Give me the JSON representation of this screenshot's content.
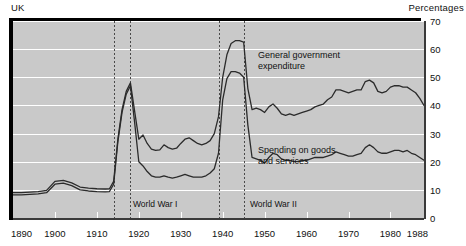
{
  "header": {
    "country_label": "UK",
    "unit_label": "Percentages"
  },
  "axes": {
    "y_ticks": [
      0,
      10,
      20,
      30,
      40,
      50,
      60,
      70
    ],
    "x_ticks": [
      1890,
      1900,
      1910,
      1920,
      1930,
      1940,
      1950,
      1960,
      1970,
      1980,
      1988
    ]
  },
  "annotations": {
    "series1_label": "General government\nexpenditure",
    "series2_label": "Spending on goods\nand services",
    "war1_label": "World War I",
    "war2_label": "World War II"
  },
  "colors": {
    "plot_background": "#c9c9c9",
    "gridline": "#ffffff",
    "line": "#2b2b2b",
    "axis": "#3a3a3a",
    "shadow": "#000000"
  },
  "chart_data": {
    "type": "line",
    "title": "",
    "xlabel": "",
    "ylabel": "Percentages",
    "xlim": [
      1890,
      1988
    ],
    "ylim": [
      0,
      70
    ],
    "grid": true,
    "legend": "inline-annotations",
    "event_markers": [
      {
        "label": "World War I",
        "start": 1914,
        "end": 1918
      },
      {
        "label": "World War II",
        "start": 1939,
        "end": 1945
      }
    ],
    "series": [
      {
        "name": "General government expenditure",
        "x": [
          1890,
          1892,
          1894,
          1896,
          1898,
          1900,
          1902,
          1904,
          1906,
          1908,
          1910,
          1912,
          1913,
          1914,
          1915,
          1916,
          1917,
          1918,
          1919,
          1920,
          1921,
          1922,
          1923,
          1924,
          1925,
          1926,
          1927,
          1928,
          1929,
          1930,
          1931,
          1932,
          1933,
          1934,
          1935,
          1936,
          1937,
          1938,
          1939,
          1940,
          1941,
          1942,
          1943,
          1944,
          1945,
          1946,
          1947,
          1948,
          1949,
          1950,
          1951,
          1952,
          1953,
          1954,
          1955,
          1956,
          1957,
          1958,
          1959,
          1960,
          1961,
          1962,
          1963,
          1964,
          1965,
          1966,
          1967,
          1968,
          1969,
          1970,
          1971,
          1972,
          1973,
          1974,
          1975,
          1976,
          1977,
          1978,
          1979,
          1980,
          1981,
          1982,
          1983,
          1984,
          1985,
          1986,
          1987,
          1988
        ],
        "values": [
          9.0,
          9.0,
          9.2,
          9.4,
          9.8,
          13.0,
          13.4,
          12.5,
          11.0,
          10.6,
          10.4,
          10.3,
          10.4,
          13.0,
          28.0,
          38.5,
          45.0,
          48.0,
          38.0,
          28.0,
          29.5,
          26.5,
          24.5,
          24.0,
          24.2,
          26.0,
          25.0,
          24.5,
          24.8,
          26.5,
          28.0,
          28.5,
          27.5,
          26.5,
          26.0,
          26.5,
          27.5,
          30.0,
          36.0,
          50.0,
          58.0,
          62.0,
          63.0,
          63.0,
          62.5,
          46.0,
          38.5,
          39.0,
          38.5,
          37.5,
          39.5,
          40.5,
          39.0,
          37.0,
          36.5,
          37.0,
          36.5,
          37.0,
          37.5,
          38.0,
          38.5,
          39.5,
          40.0,
          40.5,
          42.0,
          43.0,
          45.5,
          45.5,
          45.0,
          44.5,
          45.0,
          45.5,
          45.5,
          48.5,
          49.0,
          48.0,
          45.0,
          44.5,
          45.0,
          46.5,
          47.0,
          47.0,
          46.5,
          46.5,
          45.5,
          44.5,
          42.5,
          40.0
        ]
      },
      {
        "name": "Spending on goods and services",
        "x": [
          1890,
          1892,
          1894,
          1896,
          1898,
          1900,
          1902,
          1904,
          1906,
          1908,
          1910,
          1912,
          1913,
          1914,
          1915,
          1916,
          1917,
          1918,
          1919,
          1920,
          1921,
          1922,
          1923,
          1924,
          1925,
          1926,
          1927,
          1928,
          1929,
          1930,
          1931,
          1932,
          1933,
          1934,
          1935,
          1936,
          1937,
          1938,
          1939,
          1940,
          1941,
          1942,
          1943,
          1944,
          1945,
          1946,
          1947,
          1948,
          1949,
          1950,
          1951,
          1952,
          1953,
          1954,
          1955,
          1956,
          1957,
          1958,
          1959,
          1960,
          1961,
          1962,
          1963,
          1964,
          1965,
          1966,
          1967,
          1968,
          1969,
          1970,
          1971,
          1972,
          1973,
          1974,
          1975,
          1976,
          1977,
          1978,
          1979,
          1980,
          1981,
          1982,
          1983,
          1984,
          1985,
          1986,
          1987,
          1988
        ],
        "values": [
          8.2,
          8.2,
          8.4,
          8.6,
          9.0,
          12.0,
          12.4,
          11.5,
          10.0,
          9.6,
          9.4,
          9.3,
          9.4,
          12.0,
          27.0,
          37.5,
          44.0,
          47.0,
          34.0,
          20.0,
          18.5,
          16.5,
          15.0,
          14.5,
          14.5,
          15.0,
          14.5,
          14.2,
          14.5,
          15.0,
          15.5,
          15.0,
          14.5,
          14.5,
          14.5,
          15.0,
          16.0,
          17.5,
          23.0,
          42.0,
          49.5,
          52.0,
          52.0,
          51.5,
          50.0,
          33.0,
          21.5,
          21.0,
          20.5,
          19.5,
          21.5,
          23.0,
          22.5,
          21.0,
          20.5,
          20.5,
          20.0,
          20.0,
          20.5,
          20.5,
          21.0,
          21.5,
          21.5,
          21.5,
          22.0,
          22.5,
          23.5,
          23.0,
          22.5,
          22.0,
          22.0,
          22.5,
          23.0,
          25.0,
          26.0,
          25.0,
          23.5,
          23.0,
          23.0,
          23.5,
          24.0,
          24.0,
          23.5,
          24.0,
          23.0,
          22.5,
          21.5,
          20.5
        ]
      }
    ]
  }
}
